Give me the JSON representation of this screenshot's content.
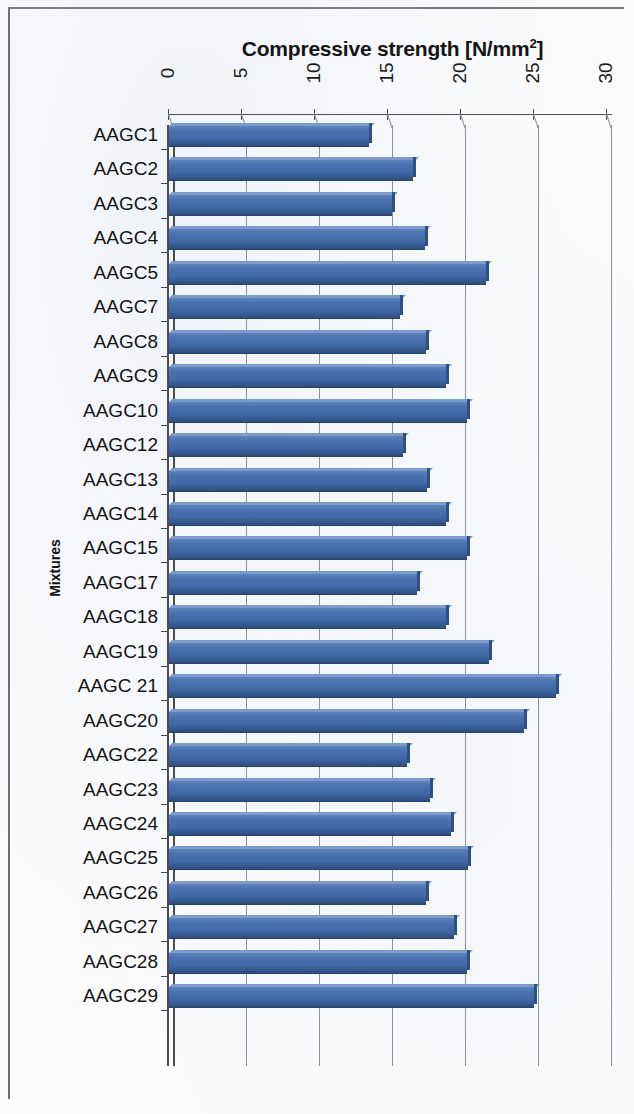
{
  "chart_data": {
    "type": "bar",
    "orientation": "horizontal",
    "title": "Compressive strength [N/mm",
    "title_sup": "2",
    "title_tail": "]",
    "title_full": "Compressive strength [N/mm2]",
    "xlabel": "Compressive strength [N/mm2]",
    "ylabel": "Mixtures",
    "xlim": [
      0,
      30
    ],
    "xticks": [
      "0",
      "5",
      "10",
      "15",
      "20",
      "25",
      "30"
    ],
    "xtick_values": [
      0,
      5,
      10,
      15,
      20,
      25,
      30
    ],
    "grid": true,
    "legend": false,
    "bar_color": "#4069a6",
    "bar_top_color": "#7b9bcb",
    "bar_side_color": "#2e5184",
    "axis_color": "#4a4c4f",
    "gridline_color": "#8e9195",
    "categories": [
      "AAGC1",
      "AAGC2",
      "AAGC3",
      "AAGC4",
      "AAGC5",
      "AAGC7",
      "AAGC8",
      "AAGC9",
      "AAGC10",
      "AAGC12",
      "AAGC13",
      "AAGC14",
      "AAGC15",
      "AAGC17",
      "AAGC18",
      "AAGC19",
      "AAGC 21",
      "AAGC20",
      "AAGC22",
      "AAGC23",
      "AAGC24",
      "AAGC25",
      "AAGC26",
      "AAGC27",
      "AAGC28",
      "AAGC29"
    ],
    "values": [
      13.7,
      16.7,
      15.3,
      17.5,
      21.7,
      15.8,
      17.6,
      19.0,
      20.4,
      16.0,
      17.7,
      19.0,
      20.4,
      17.0,
      19.0,
      21.9,
      26.5,
      24.3,
      16.3,
      17.9,
      19.3,
      20.5,
      17.6,
      19.5,
      20.4,
      25.0
    ]
  }
}
